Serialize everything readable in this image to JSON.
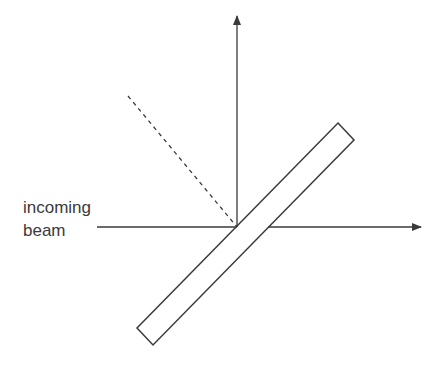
{
  "diagram": {
    "type": "optics-beam-splitter",
    "labels": {
      "incoming_line1": "incoming",
      "incoming_line2": "beam"
    },
    "colors": {
      "stroke": "#3a3a3a",
      "background": "#ffffff"
    },
    "elements": {
      "incoming_beam": {
        "x1": 97,
        "y1": 227,
        "x2": 237,
        "y2": 227
      },
      "transmitted_beam": {
        "x1": 268,
        "y1": 227,
        "x2": 420,
        "y2": 227
      },
      "reflected_beam": {
        "x1": 237,
        "y1": 227,
        "x2": 237,
        "y2": 18
      },
      "dashed_line": {
        "x1": 128,
        "y1": 96,
        "x2": 237,
        "y2": 227
      },
      "slab_corners": [
        [
          338,
          123
        ],
        [
          354,
          140
        ],
        [
          153,
          345
        ],
        [
          137,
          328
        ]
      ]
    }
  }
}
